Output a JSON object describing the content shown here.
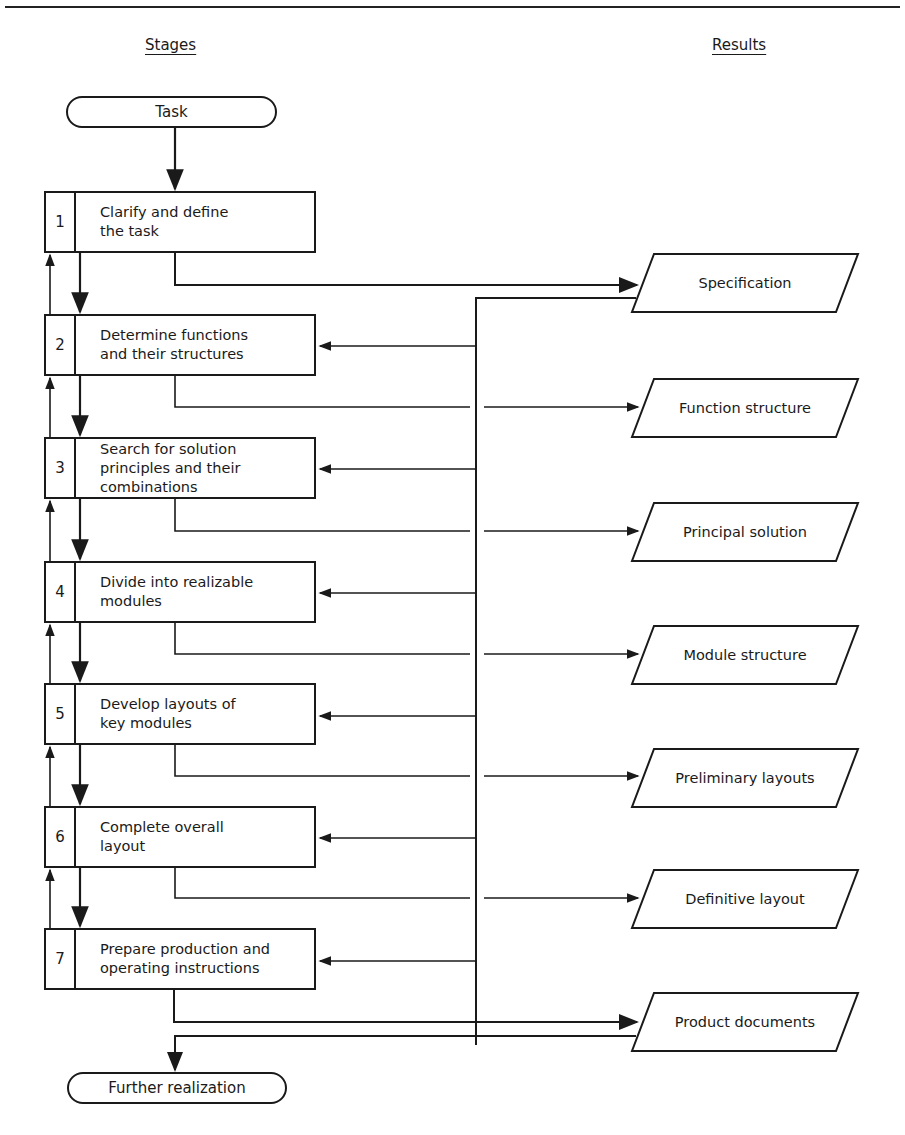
{
  "headers": {
    "stages": "Stages",
    "results": "Results"
  },
  "start": {
    "label": "Task"
  },
  "end": {
    "label": "Further realization"
  },
  "stages": [
    {
      "num": "1",
      "label": "Clarify and define\nthe task",
      "top": 191
    },
    {
      "num": "2",
      "label": "Determine functions\nand their structures",
      "top": 314
    },
    {
      "num": "3",
      "label": "Search for solution\nprinciples and their\ncombinations",
      "top": 437
    },
    {
      "num": "4",
      "label": "Divide into realizable\nmodules",
      "top": 561
    },
    {
      "num": "5",
      "label": "Develop layouts of\nkey modules",
      "top": 683
    },
    {
      "num": "6",
      "label": "Complete overall\nlayout",
      "top": 806
    },
    {
      "num": "7",
      "label": "Prepare production and\noperating instructions",
      "top": 928
    }
  ],
  "results": [
    {
      "label": "Specification",
      "top": 252
    },
    {
      "label": "Function structure",
      "top": 377
    },
    {
      "label": "Principal solution",
      "top": 501
    },
    {
      "label": "Module structure",
      "top": 624
    },
    {
      "label": "Preliminary layouts",
      "top": 747
    },
    {
      "label": "Definitive layout",
      "top": 868
    },
    {
      "label": "Product documents",
      "top": 991
    }
  ]
}
